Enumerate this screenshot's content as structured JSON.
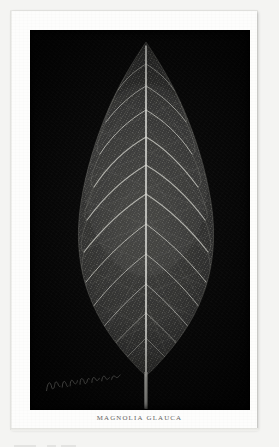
{
  "plate": {
    "caption_genus": "Magnolia",
    "caption_species": "Glauca",
    "caption_full": "MAGNOLIA GLAUCA",
    "signature_name": "signature-script",
    "background_color": "#050505",
    "paper_color": "#fdfdfc",
    "page_color": "#f4f4f2"
  },
  "specimen": {
    "common_subject": "leaf",
    "vein_color": "#cfcfcb",
    "blade_color": "#2a2a28",
    "petiole_color": "#b9b9b4"
  },
  "icons": {
    "leaf": "leaf-icon",
    "signature": "signature-icon"
  }
}
